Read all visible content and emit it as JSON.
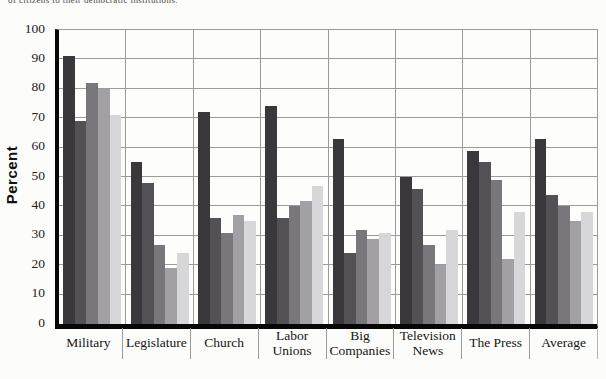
{
  "page": {
    "cropped_caption": "of citizens to their democratic institutions."
  },
  "chart": {
    "ylabel": "Percent",
    "yticks": [
      0,
      10,
      20,
      30,
      40,
      50,
      60,
      70,
      80,
      90,
      100
    ]
  },
  "chart_data": {
    "type": "bar",
    "title": "",
    "xlabel": "",
    "ylabel": "Percent",
    "ylim": [
      0,
      100
    ],
    "ytick_step": 10,
    "grid": true,
    "legend": "none",
    "bar_colors": [
      "#3a383b",
      "#535156",
      "#79777b",
      "#a2a0a4",
      "#d7d6d8"
    ],
    "categories": [
      "Military",
      "Legislature",
      "Church",
      "Labor Unions",
      "Big Companies",
      "Television News",
      "The Press",
      "Average"
    ],
    "series": [
      {
        "name": "series-1",
        "color": "#3a383b",
        "values": [
          91,
          55,
          72,
          74,
          63,
          50,
          59,
          63
        ]
      },
      {
        "name": "series-2",
        "color": "#535156",
        "values": [
          69,
          48,
          36,
          36,
          24,
          46,
          55,
          44
        ]
      },
      {
        "name": "series-3",
        "color": "#79777b",
        "values": [
          82,
          27,
          31,
          40,
          32,
          27,
          49,
          40
        ]
      },
      {
        "name": "series-4",
        "color": "#a2a0a4",
        "values": [
          80,
          19,
          37,
          42,
          29,
          20,
          22,
          35
        ]
      },
      {
        "name": "series-5",
        "color": "#d7d6d8",
        "values": [
          71,
          24,
          35,
          47,
          31,
          32,
          38,
          38
        ]
      }
    ]
  }
}
